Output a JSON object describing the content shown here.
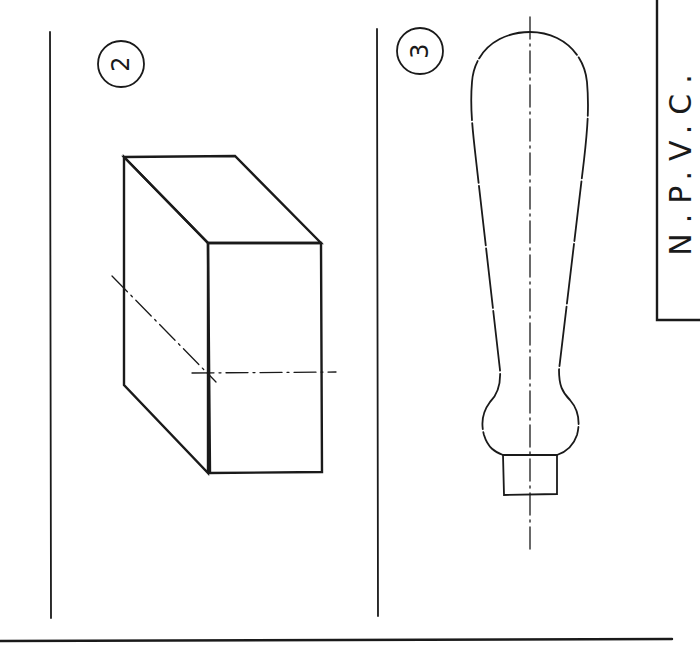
{
  "drawing": {
    "views": [
      {
        "id": "2",
        "label": "2",
        "subject": "rectangular block (isometric)"
      },
      {
        "id": "3",
        "label": "3",
        "subject": "handle profile"
      }
    ],
    "title_block": {
      "text": "N.P.V.C.",
      "letters": [
        "N",
        ".",
        "P",
        ".",
        "V",
        ".",
        "C",
        "."
      ]
    }
  },
  "colors": {
    "ink": "#1a1a1a",
    "paper": "#ffffff"
  }
}
